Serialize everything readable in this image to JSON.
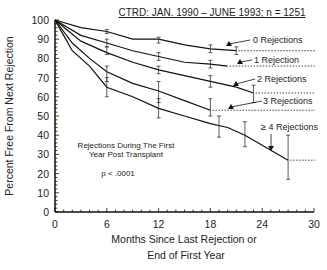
{
  "chart_data": {
    "type": "line",
    "title": "CTRD:   JAN. 1990 – JUNE 1993;  n = 1251",
    "xlabel": "Months Since Last Rejection or\nEnd of First Year",
    "xlabel_lines": [
      "Months Since Last Rejection or",
      "End of First Year"
    ],
    "ylabel": "Percent Free From Next Rejection",
    "xlim": [
      0,
      30
    ],
    "ylim": [
      0,
      100
    ],
    "xticks": [
      0,
      6,
      12,
      18,
      24,
      30
    ],
    "yticks": [
      0,
      10,
      20,
      30,
      40,
      50,
      60,
      70,
      80,
      90,
      100
    ],
    "grid": false,
    "annotations": {
      "legend_title_lines": [
        "Rejections During The First",
        "Year Post Transplant"
      ],
      "pvalue": "p < .0001"
    },
    "series": [
      {
        "name": "0 Rejections",
        "x": [
          0,
          3,
          6,
          9,
          12,
          15,
          18,
          21
        ],
        "y": [
          100,
          96,
          94,
          90,
          90,
          87,
          85,
          84
        ],
        "end_projection": 84,
        "error_bars": [
          {
            "x": 6,
            "y": 94,
            "lo": 93,
            "hi": 95
          },
          {
            "x": 12,
            "y": 90,
            "lo": 88,
            "hi": 91
          },
          {
            "x": 18,
            "y": 85,
            "lo": 83,
            "hi": 87
          },
          {
            "x": 21,
            "y": 84,
            "lo": 82,
            "hi": 86
          }
        ]
      },
      {
        "name": "1 Rejection",
        "x": [
          0,
          3,
          6,
          9,
          12,
          15,
          18,
          20
        ],
        "y": [
          100,
          92,
          88,
          84,
          81,
          78,
          77,
          76
        ],
        "end_projection": 76,
        "error_bars": [
          {
            "x": 6,
            "y": 88,
            "lo": 86,
            "hi": 90
          },
          {
            "x": 12,
            "y": 81,
            "lo": 79,
            "hi": 83
          },
          {
            "x": 18,
            "y": 77,
            "lo": 75,
            "hi": 79
          }
        ]
      },
      {
        "name": "2 Rejections",
        "x": [
          0,
          3,
          6,
          9,
          12,
          15,
          18,
          21,
          23
        ],
        "y": [
          100,
          89,
          83,
          78,
          74,
          71,
          68,
          65,
          62
        ],
        "end_projection": 62,
        "error_bars": [
          {
            "x": 6,
            "y": 84,
            "lo": 82,
            "hi": 86
          },
          {
            "x": 12,
            "y": 74,
            "lo": 72,
            "hi": 76
          },
          {
            "x": 18,
            "y": 68,
            "lo": 65,
            "hi": 71
          },
          {
            "x": 23,
            "y": 62,
            "lo": 57,
            "hi": 66
          }
        ]
      },
      {
        "name": "3 Rejections",
        "x": [
          0,
          2,
          4,
          6,
          9,
          12,
          15,
          18
        ],
        "y": [
          100,
          88,
          80,
          73,
          67,
          63,
          58,
          53
        ],
        "end_projection": 53,
        "error_bars": [
          {
            "x": 6,
            "y": 72,
            "lo": 68,
            "hi": 76
          },
          {
            "x": 12,
            "y": 63,
            "lo": 57,
            "hi": 68
          },
          {
            "x": 18,
            "y": 54,
            "lo": 50,
            "hi": 59
          }
        ]
      },
      {
        "name": "≥ 4 Rejections",
        "x": [
          0,
          1,
          2,
          4,
          6,
          9,
          12,
          15,
          18,
          20,
          22,
          27
        ],
        "y": [
          100,
          92,
          84,
          76,
          65,
          60,
          54,
          50,
          46,
          44,
          40,
          27
        ],
        "end_projection": 27,
        "error_bars": [
          {
            "x": 6,
            "y": 65,
            "lo": 60,
            "hi": 70
          },
          {
            "x": 12,
            "y": 54,
            "lo": 49,
            "hi": 59
          },
          {
            "x": 19,
            "y": 45,
            "lo": 39,
            "hi": 50
          },
          {
            "x": 22,
            "y": 40,
            "lo": 34,
            "hi": 47
          },
          {
            "x": 27,
            "y": 27,
            "lo": 17,
            "hi": 40
          }
        ]
      }
    ]
  }
}
